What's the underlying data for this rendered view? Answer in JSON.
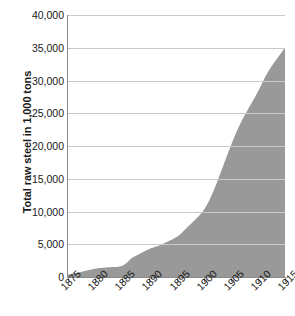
{
  "chart_data": {
    "type": "area",
    "title": "",
    "xlabel": "",
    "ylabel": "Total raw steel in 1,000 tons",
    "x": [
      1875,
      1880,
      1885,
      1890,
      1895,
      1900,
      1905,
      1910,
      1915
    ],
    "categories": [
      "1875",
      "1880",
      "1885",
      "1890",
      "1895",
      "1900",
      "1905",
      "1910",
      "1915"
    ],
    "values": [
      380,
      1250,
      1700,
      4280,
      6100,
      10200,
      20000,
      28300,
      35000
    ],
    "series": [
      {
        "name": "Total raw steel",
        "values": [
          380,
          1250,
          1700,
          4280,
          6100,
          10200,
          20000,
          28300,
          35000
        ]
      }
    ],
    "points": [
      {
        "x": 1875,
        "y": 380
      },
      {
        "x": 1877,
        "y": 700
      },
      {
        "x": 1880,
        "y": 1250
      },
      {
        "x": 1882,
        "y": 1450
      },
      {
        "x": 1885,
        "y": 1700
      },
      {
        "x": 1887,
        "y": 3000
      },
      {
        "x": 1890,
        "y": 4280
      },
      {
        "x": 1892,
        "y": 4900
      },
      {
        "x": 1895,
        "y": 6100
      },
      {
        "x": 1897,
        "y": 7600
      },
      {
        "x": 1900,
        "y": 10200
      },
      {
        "x": 1902,
        "y": 13500
      },
      {
        "x": 1905,
        "y": 20000
      },
      {
        "x": 1907,
        "y": 23800
      },
      {
        "x": 1910,
        "y": 28300
      },
      {
        "x": 1912,
        "y": 31500
      },
      {
        "x": 1915,
        "y": 35000
      }
    ],
    "xlim": [
      1875,
      1915
    ],
    "ylim": [
      0,
      40000
    ],
    "ytick_labels": [
      "40,000",
      "35,000",
      "30,000",
      "25,000",
      "20,000",
      "15,000",
      "10,000",
      "5,000",
      "0"
    ],
    "ytick_values": [
      40000,
      35000,
      30000,
      25000,
      20000,
      15000,
      10000,
      5000,
      0
    ],
    "grid": true,
    "legend": "none",
    "colors": {
      "area_fill": "#999999",
      "gridline": "#c9c9c9",
      "axis": "#8a8a8a",
      "text": "#1a1a1a",
      "background": "#ffffff"
    }
  }
}
